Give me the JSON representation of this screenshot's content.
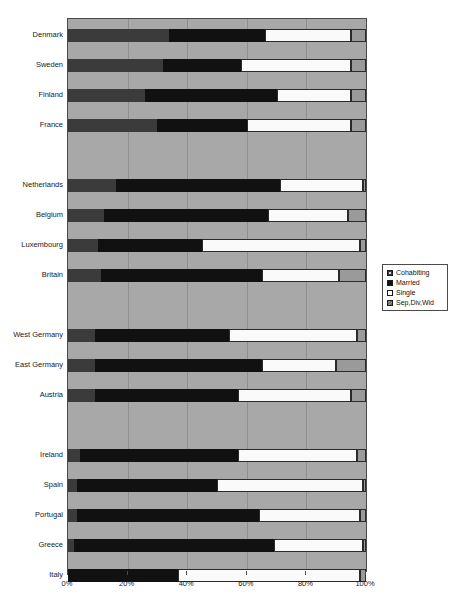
{
  "chart_data": {
    "type": "bar",
    "orientation": "horizontal",
    "stacked": true,
    "title": "",
    "xlabel": "",
    "ylabel": "",
    "xlim": [
      0,
      100
    ],
    "xticks": [
      "0%",
      "20%",
      "40%",
      "60%",
      "80%",
      "100%"
    ],
    "xtick_values": [
      0,
      20,
      40,
      60,
      80,
      100
    ],
    "grid": true,
    "legend_position": "right",
    "categories": [
      "Denmark",
      "Sweden",
      "Finland",
      "France",
      "Netherlands",
      "Belgium",
      "Luxembourg",
      "Britain",
      "West Germany",
      "East Germany",
      "Austria",
      "Ireland",
      "Spain",
      "Portugal",
      "Greece",
      "Italy"
    ],
    "groups": [
      {
        "name": "Nordic/France",
        "categories": [
          "Denmark",
          "Sweden",
          "Finland",
          "France"
        ]
      },
      {
        "name": "Low Countries/Britain",
        "categories": [
          "Netherlands",
          "Belgium",
          "Luxembourg",
          "Britain"
        ]
      },
      {
        "name": "German-speaking",
        "categories": [
          "West Germany",
          "East Germany",
          "Austria"
        ]
      },
      {
        "name": "Southern/Ireland",
        "categories": [
          "Ireland",
          "Spain",
          "Portugal",
          "Greece",
          "Italy"
        ]
      }
    ],
    "series": [
      {
        "name": "Cohabiting",
        "color": "#3b3b3b",
        "values": [
          34,
          32,
          26,
          30,
          16,
          12,
          10,
          11,
          9,
          9,
          9,
          4,
          3,
          3,
          2,
          0
        ]
      },
      {
        "name": "Married",
        "color": "#111111",
        "values": [
          32,
          26,
          44,
          30,
          55,
          55,
          35,
          54,
          45,
          56,
          48,
          53,
          47,
          61,
          67,
          37
        ]
      },
      {
        "name": "Single",
        "color": "#fafafa",
        "values": [
          29,
          37,
          25,
          35,
          28,
          27,
          53,
          26,
          43,
          25,
          38,
          40,
          49,
          34,
          30,
          61
        ]
      },
      {
        "name": "Sep,Div,Wid",
        "color": "#9a9a9a",
        "values": [
          5,
          5,
          5,
          5,
          1,
          6,
          2,
          9,
          3,
          10,
          5,
          3,
          1,
          2,
          1,
          2
        ]
      }
    ],
    "legend": [
      {
        "label": "Cohabiting",
        "swatch": "cohabiting"
      },
      {
        "label": "Married",
        "swatch": "married"
      },
      {
        "label": "Single",
        "swatch": "single"
      },
      {
        "label": "Sep,Div,Wid",
        "swatch": "sepdivwid"
      }
    ],
    "row_layout": {
      "plot_top": 18,
      "plot_left": 67,
      "plot_width": 298,
      "plot_height": 552,
      "bar_tops": [
        10,
        40,
        70,
        100,
        160,
        190,
        220,
        250,
        310,
        340,
        370,
        430,
        460,
        490,
        520,
        550
      ]
    }
  }
}
